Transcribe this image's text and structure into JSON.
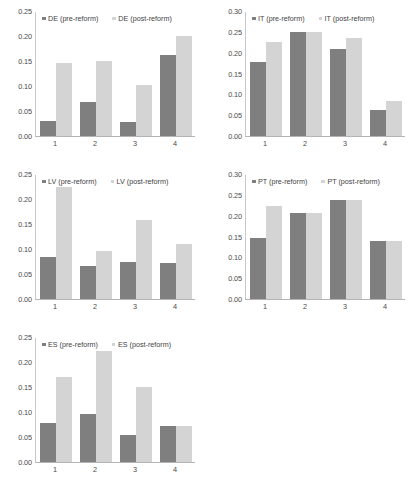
{
  "figure": {
    "panel_count": 5,
    "series_names": [
      "pre-reform",
      "post-reform"
    ],
    "colors": {
      "pre_reform": "#7f7f7f",
      "post_reform": "#d4d4d4",
      "axis": "#b4b4b4",
      "text": "#3a3a3a",
      "background": "#ffffff"
    }
  },
  "chart_data": [
    {
      "type": "bar",
      "title": "",
      "country": "DE",
      "xlabel": "",
      "ylabel": "",
      "categories": [
        "1",
        "2",
        "3",
        "4"
      ],
      "ylim": [
        0.0,
        0.25
      ],
      "yticks": [
        "0.00",
        "0.05",
        "0.10",
        "0.15",
        "0.20",
        "0.25"
      ],
      "ytick_values": [
        0.0,
        0.05,
        0.1,
        0.15,
        0.2,
        0.25
      ],
      "grid": false,
      "legend_position": "top",
      "series": [
        {
          "name": "DE (pre-reform)",
          "values": [
            0.03,
            0.068,
            0.029,
            0.162
          ]
        },
        {
          "name": "DE (post-reform)",
          "values": [
            0.146,
            0.15,
            0.103,
            0.2
          ]
        }
      ]
    },
    {
      "type": "bar",
      "title": "",
      "country": "IT",
      "xlabel": "",
      "ylabel": "",
      "categories": [
        "1",
        "2",
        "3",
        "4"
      ],
      "ylim": [
        0.0,
        0.3
      ],
      "yticks": [
        "0.00",
        "0.05",
        "0.10",
        "0.15",
        "0.20",
        "0.25",
        "0.30"
      ],
      "ytick_values": [
        0.0,
        0.05,
        0.1,
        0.15,
        0.2,
        0.25,
        0.3
      ],
      "grid": false,
      "legend_position": "top",
      "series": [
        {
          "name": "IT (pre-reform)",
          "values": [
            0.178,
            0.249,
            0.209,
            0.063
          ]
        },
        {
          "name": "IT (post-reform)",
          "values": [
            0.225,
            0.249,
            0.236,
            0.083
          ]
        }
      ]
    },
    {
      "type": "bar",
      "title": "",
      "country": "LV",
      "xlabel": "",
      "ylabel": "",
      "categories": [
        "1",
        "2",
        "3",
        "4"
      ],
      "ylim": [
        0.0,
        0.25
      ],
      "yticks": [
        "0.00",
        "0.05",
        "0.10",
        "0.15",
        "0.20",
        "0.25"
      ],
      "ytick_values": [
        0.0,
        0.05,
        0.1,
        0.15,
        0.2,
        0.25
      ],
      "grid": false,
      "legend_position": "top",
      "series": [
        {
          "name": "LV (pre-reform)",
          "values": [
            0.085,
            0.067,
            0.074,
            0.073
          ]
        },
        {
          "name": "LV (post-reform)",
          "values": [
            0.224,
            0.096,
            0.159,
            0.111
          ]
        }
      ]
    },
    {
      "type": "bar",
      "title": "",
      "country": "PT",
      "xlabel": "",
      "ylabel": "",
      "categories": [
        "1",
        "2",
        "3",
        "4"
      ],
      "ylim": [
        0.0,
        0.3
      ],
      "yticks": [
        "0.00",
        "0.05",
        "0.10",
        "0.15",
        "0.20",
        "0.25",
        "0.30"
      ],
      "ytick_values": [
        0.0,
        0.05,
        0.1,
        0.15,
        0.2,
        0.25,
        0.3
      ],
      "grid": false,
      "legend_position": "top",
      "series": [
        {
          "name": "PT (pre-reform)",
          "values": [
            0.147,
            0.206,
            0.237,
            0.139
          ]
        },
        {
          "name": "PT (post-reform)",
          "values": [
            0.223,
            0.206,
            0.237,
            0.139
          ]
        }
      ]
    },
    {
      "type": "bar",
      "title": "",
      "country": "ES",
      "xlabel": "",
      "ylabel": "",
      "categories": [
        "1",
        "2",
        "3",
        "4"
      ],
      "ylim": [
        0.0,
        0.25
      ],
      "yticks": [
        "0.00",
        "0.05",
        "0.10",
        "0.15",
        "0.20",
        "0.25"
      ],
      "ytick_values": [
        0.0,
        0.05,
        0.1,
        0.15,
        0.2,
        0.25
      ],
      "grid": false,
      "legend_position": "top",
      "series": [
        {
          "name": "ES (pre-reform)",
          "values": [
            0.078,
            0.097,
            0.055,
            0.072
          ]
        },
        {
          "name": "ES (post-reform)",
          "values": [
            0.171,
            0.222,
            0.15,
            0.072
          ]
        }
      ]
    }
  ]
}
